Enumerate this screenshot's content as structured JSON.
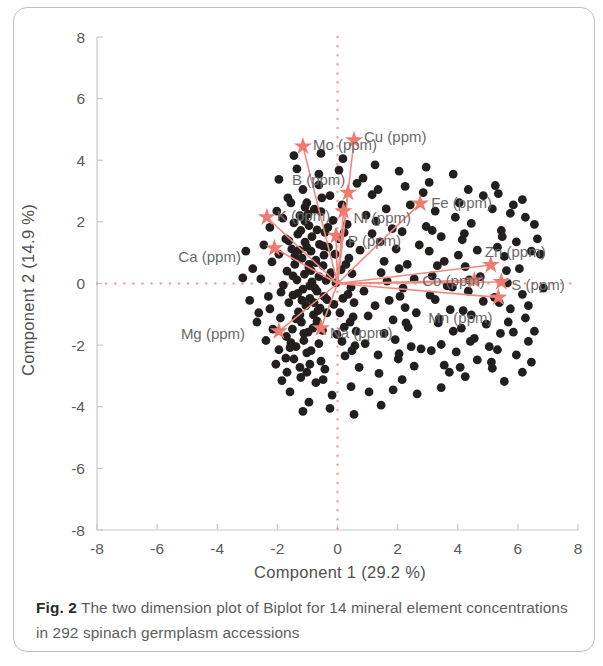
{
  "figure": {
    "caption_label": "Fig. 2",
    "caption_text": " The two dimension plot of Biplot for 14 mineral element concentrations in 292 spinach germplasm accessions"
  },
  "colors": {
    "vector": "#f08a80",
    "vector_dark": "#ee7a70",
    "point": "#231f1e",
    "axis": "#c9c9c9",
    "grid_ref": "#f3a09a",
    "text": "#5a5a5a",
    "frame": "#bfbfbf"
  },
  "chart_data": {
    "type": "scatter",
    "title": "",
    "subtitle": "",
    "xlabel": "Component 1  (29.2 %)",
    "ylabel": "Component 2  (14.9 %)",
    "xlim": [
      -8,
      8
    ],
    "ylim": [
      -8,
      8
    ],
    "xticks": [
      -8,
      -6,
      -4,
      -2,
      0,
      2,
      4,
      6,
      8
    ],
    "yticks": [
      -8,
      -6,
      -4,
      -2,
      0,
      2,
      4,
      6,
      8
    ],
    "xtick_labels": [
      "-8",
      "-6",
      "-4",
      "-2",
      "0",
      "2",
      "4",
      "6",
      "8"
    ],
    "ytick_labels": [
      "-8",
      "-6",
      "-4",
      "-2",
      "0",
      "2",
      "4",
      "6",
      "8"
    ],
    "grid": false,
    "reference_lines": {
      "x": 0,
      "y": 0,
      "style": "dotted",
      "color": "#f3a09a"
    },
    "legend": "none",
    "n_observations": 292,
    "n_variables": 14,
    "variance_explained": {
      "component_1": 29.2,
      "component_2": 14.9
    },
    "loading_vectors": [
      {
        "name": "Mo (ppm)",
        "x": -1.15,
        "y": 4.45,
        "label_dx": 10,
        "label_dy": 4,
        "label_anchor": "start"
      },
      {
        "name": "Cu (ppm)",
        "x": 0.55,
        "y": 4.65,
        "label_dx": 10,
        "label_dy": 2,
        "label_anchor": "start"
      },
      {
        "name": "B (ppm)",
        "x": 0.35,
        "y": 2.95,
        "label_dx": -56,
        "label_dy": -8,
        "label_anchor": "start"
      },
      {
        "name": "Fe (ppm)",
        "x": 2.75,
        "y": 2.6,
        "label_dx": 11,
        "label_dy": 5,
        "label_anchor": "start"
      },
      {
        "name": "K (ppm)",
        "x": -2.35,
        "y": 2.15,
        "label_dx": 10,
        "label_dy": 4,
        "label_anchor": "start"
      },
      {
        "name": "Ni (ppm)",
        "x": 0.2,
        "y": 2.35,
        "label_dx": 10,
        "label_dy": 12,
        "label_anchor": "start"
      },
      {
        "name": "P (ppm)",
        "x": -0.05,
        "y": 1.55,
        "label_dx": 12,
        "label_dy": 10,
        "label_anchor": "start"
      },
      {
        "name": "Ca (ppm)",
        "x": -2.1,
        "y": 1.15,
        "label_dx": -96,
        "label_dy": 14,
        "label_anchor": "start"
      },
      {
        "name": "Zn (ppm)",
        "x": 5.1,
        "y": 0.6,
        "label_dx": -6,
        "label_dy": -8,
        "label_anchor": "start"
      },
      {
        "name": "S (ppm)",
        "x": 5.45,
        "y": 0.05,
        "label_dx": 10,
        "label_dy": 8,
        "label_anchor": "start"
      },
      {
        "name": "Co (ppm)",
        "x": 4.55,
        "y": 0.1,
        "label_dx": -52,
        "label_dy": 6,
        "label_anchor": "start"
      },
      {
        "name": "Mn (ppm)",
        "x": 5.35,
        "y": -0.45,
        "label_dx": -70,
        "label_dy": 26,
        "label_anchor": "start"
      },
      {
        "name": "Na (ppm)",
        "x": -0.55,
        "y": -1.45,
        "label_dx": 9,
        "label_dy": 10,
        "label_anchor": "start"
      },
      {
        "name": "Mg (ppm)",
        "x": -1.95,
        "y": -1.55,
        "label_dx": -98,
        "label_dy": 8,
        "label_anchor": "start"
      }
    ],
    "scores": [
      [
        -1.02,
        2.62
      ],
      [
        -0.77,
        2.41
      ],
      [
        -1.25,
        2.2
      ],
      [
        -0.55,
        2.33
      ],
      [
        -1.45,
        1.97
      ],
      [
        -0.95,
        1.88
      ],
      [
        -0.68,
        1.74
      ],
      [
        -1.32,
        1.6
      ],
      [
        -0.42,
        1.66
      ],
      [
        -1.72,
        1.45
      ],
      [
        -1.08,
        1.34
      ],
      [
        -0.6,
        1.27
      ],
      [
        -1.52,
        1.12
      ],
      [
        -0.88,
        1.05
      ],
      [
        -0.3,
        1.18
      ],
      [
        -1.95,
        0.95
      ],
      [
        -1.18,
        0.82
      ],
      [
        -0.72,
        0.76
      ],
      [
        -1.42,
        0.62
      ],
      [
        -0.95,
        0.52
      ],
      [
        -0.48,
        0.58
      ],
      [
        -1.68,
        0.4
      ],
      [
        -1.1,
        0.3
      ],
      [
        -0.62,
        0.22
      ],
      [
        -1.35,
        0.12
      ],
      [
        -0.85,
        0.05
      ],
      [
        -0.38,
        0.1
      ],
      [
        -1.8,
        -0.05
      ],
      [
        -1.15,
        -0.18
      ],
      [
        -0.68,
        -0.25
      ],
      [
        -1.48,
        -0.38
      ],
      [
        -0.92,
        -0.48
      ],
      [
        -0.45,
        -0.42
      ],
      [
        -1.62,
        -0.62
      ],
      [
        -1.05,
        -0.72
      ],
      [
        -0.58,
        -0.8
      ],
      [
        -1.3,
        -0.92
      ],
      [
        -0.8,
        -1.02
      ],
      [
        -0.35,
        -0.95
      ],
      [
        -1.9,
        -1.12
      ],
      [
        -1.2,
        -1.25
      ],
      [
        -0.7,
        -1.35
      ],
      [
        -1.5,
        -1.48
      ],
      [
        -0.98,
        -1.58
      ],
      [
        -0.5,
        -1.52
      ],
      [
        -1.7,
        -1.72
      ],
      [
        -1.12,
        -1.85
      ],
      [
        -0.62,
        -1.95
      ],
      [
        -1.38,
        -2.05
      ],
      [
        -0.88,
        -2.18
      ],
      [
        -0.25,
        2.85
      ],
      [
        0.15,
        2.55
      ],
      [
        -0.15,
        2.05
      ],
      [
        0.32,
        1.92
      ],
      [
        0.05,
        1.45
      ],
      [
        0.42,
        1.3
      ],
      [
        -0.08,
        0.95
      ],
      [
        0.38,
        0.82
      ],
      [
        0.12,
        0.45
      ],
      [
        0.48,
        0.32
      ],
      [
        -0.05,
        0.02
      ],
      [
        0.45,
        -0.12
      ],
      [
        0.18,
        -0.48
      ],
      [
        0.55,
        -0.62
      ],
      [
        0.08,
        -0.95
      ],
      [
        0.52,
        -1.08
      ],
      [
        0.22,
        -1.42
      ],
      [
        0.62,
        -1.55
      ],
      [
        0.15,
        -1.88
      ],
      [
        0.58,
        -2.02
      ],
      [
        -1.15,
        3.05
      ],
      [
        -0.62,
        3.2
      ],
      [
        -1.65,
        2.78
      ],
      [
        -2.02,
        2.35
      ],
      [
        -2.25,
        1.82
      ],
      [
        -2.45,
        1.25
      ],
      [
        -2.18,
        0.7
      ],
      [
        -2.55,
        0.15
      ],
      [
        -2.3,
        -0.42
      ],
      [
        -2.62,
        -0.95
      ],
      [
        -2.15,
        -1.48
      ],
      [
        -1.95,
        -2.15
      ],
      [
        -1.45,
        -2.45
      ],
      [
        -0.92,
        -2.62
      ],
      [
        -0.42,
        -2.78
      ],
      [
        -1.68,
        -2.88
      ],
      [
        -1.22,
        -3.05
      ],
      [
        -0.72,
        -3.22
      ],
      [
        -1.88,
        -0.28
      ],
      [
        -2.38,
        -1.85
      ],
      [
        1.15,
        2.88
      ],
      [
        1.62,
        2.42
      ],
      [
        1.28,
        2.02
      ],
      [
        1.82,
        1.78
      ],
      [
        1.42,
        1.35
      ],
      [
        1.95,
        1.12
      ],
      [
        1.55,
        0.72
      ],
      [
        2.05,
        0.48
      ],
      [
        1.65,
        0.08
      ],
      [
        2.18,
        -0.15
      ],
      [
        1.72,
        -0.55
      ],
      [
        2.25,
        -0.78
      ],
      [
        1.85,
        -1.18
      ],
      [
        2.35,
        -1.42
      ],
      [
        1.92,
        -1.82
      ],
      [
        2.45,
        -2.05
      ],
      [
        2.02,
        -2.45
      ],
      [
        2.55,
        -2.68
      ],
      [
        1.38,
        -2.92
      ],
      [
        2.15,
        -3.12
      ],
      [
        2.85,
        2.95
      ],
      [
        3.25,
        2.35
      ],
      [
        2.95,
        1.85
      ],
      [
        3.45,
        1.52
      ],
      [
        3.05,
        1.05
      ],
      [
        3.55,
        0.72
      ],
      [
        3.15,
        0.25
      ],
      [
        3.65,
        -0.08
      ],
      [
        3.25,
        -0.52
      ],
      [
        3.75,
        -0.85
      ],
      [
        3.35,
        -1.28
      ],
      [
        3.85,
        -1.55
      ],
      [
        3.45,
        -1.98
      ],
      [
        3.95,
        -2.22
      ],
      [
        3.55,
        -2.65
      ],
      [
        4.05,
        2.62
      ],
      [
        4.45,
        1.95
      ],
      [
        4.15,
        1.42
      ],
      [
        4.65,
        1.08
      ],
      [
        4.25,
        0.55
      ],
      [
        4.75,
        0.22
      ],
      [
        4.35,
        -0.25
      ],
      [
        4.85,
        -0.58
      ],
      [
        4.45,
        -1.02
      ],
      [
        4.95,
        -1.32
      ],
      [
        4.55,
        -1.78
      ],
      [
        5.05,
        -2.05
      ],
      [
        4.65,
        -2.48
      ],
      [
        5.15,
        -2.75
      ],
      [
        4.25,
        -3.02
      ],
      [
        5.35,
        2.92
      ],
      [
        5.75,
        2.28
      ],
      [
        5.45,
        1.72
      ],
      [
        5.95,
        1.35
      ],
      [
        5.55,
        0.88
      ],
      [
        6.05,
        0.48
      ],
      [
        5.65,
        0.02
      ],
      [
        6.15,
        -0.35
      ],
      [
        5.75,
        -0.82
      ],
      [
        6.25,
        -1.12
      ],
      [
        5.85,
        -1.58
      ],
      [
        6.35,
        -1.88
      ],
      [
        5.95,
        -2.32
      ],
      [
        6.45,
        -2.55
      ],
      [
        5.55,
        -3.18
      ],
      [
        0.85,
        3.42
      ],
      [
        1.35,
        3.05
      ],
      [
        2.25,
        3.15
      ],
      [
        3.05,
        3.28
      ],
      [
        4.35,
        3.05
      ],
      [
        5.25,
        3.18
      ],
      [
        6.15,
        2.72
      ],
      [
        6.55,
        1.92
      ],
      [
        6.75,
        0.95
      ],
      [
        6.85,
        -0.15
      ],
      [
        0.45,
        -3.35
      ],
      [
        1.05,
        -3.52
      ],
      [
        1.85,
        -3.45
      ],
      [
        2.65,
        -3.58
      ],
      [
        3.45,
        -3.38
      ],
      [
        -0.18,
        -3.62
      ],
      [
        -0.95,
        -3.85
      ],
      [
        -1.58,
        -3.52
      ],
      [
        0.25,
        -2.35
      ],
      [
        0.72,
        -2.72
      ],
      [
        -1.08,
        2.02
      ],
      [
        -0.85,
        1.52
      ],
      [
        -1.28,
        1.08
      ],
      [
        -0.72,
        0.68
      ],
      [
        -1.48,
        0.25
      ],
      [
        -0.92,
        -0.08
      ],
      [
        -1.18,
        -0.55
      ],
      [
        -0.65,
        -0.88
      ],
      [
        -1.38,
        -1.15
      ],
      [
        -0.82,
        -1.45
      ],
      [
        -1.55,
        -1.92
      ],
      [
        -1.02,
        -2.25
      ],
      [
        -0.55,
        -2.52
      ],
      [
        -1.72,
        -2.42
      ],
      [
        -1.25,
        -2.72
      ],
      [
        -0.32,
        1.82
      ],
      [
        0.22,
        1.65
      ],
      [
        -0.48,
        1.22
      ],
      [
        0.28,
        0.62
      ],
      [
        -0.22,
        0.35
      ],
      [
        0.35,
        -0.35
      ],
      [
        -0.12,
        -0.68
      ],
      [
        0.42,
        -1.25
      ],
      [
        -0.02,
        -1.65
      ],
      [
        0.48,
        -2.18
      ],
      [
        -2.82,
        0.48
      ],
      [
        -2.92,
        -0.55
      ],
      [
        -3.05,
        1.05
      ],
      [
        -2.68,
        -1.25
      ],
      [
        -3.15,
        0.18
      ],
      [
        2.42,
        2.55
      ],
      [
        2.72,
        1.25
      ],
      [
        2.55,
        0.15
      ],
      [
        2.62,
        -0.95
      ],
      [
        2.78,
        -2.12
      ],
      [
        3.92,
        2.15
      ],
      [
        4.02,
        0.92
      ],
      [
        3.82,
        -0.12
      ],
      [
        4.12,
        -1.45
      ],
      [
        3.72,
        -2.88
      ],
      [
        5.15,
        2.42
      ],
      [
        5.32,
        1.18
      ],
      [
        5.22,
        -0.45
      ],
      [
        5.42,
        -1.62
      ],
      [
        5.12,
        -2.55
      ],
      [
        6.25,
        2.15
      ],
      [
        6.45,
        1.05
      ],
      [
        6.35,
        -0.72
      ],
      [
        6.55,
        -1.55
      ],
      [
        6.15,
        -2.88
      ],
      [
        -0.62,
        3.55
      ],
      [
        0.05,
        3.68
      ],
      [
        -1.35,
        3.72
      ],
      [
        0.65,
        3.25
      ],
      [
        -1.95,
        3.38
      ],
      [
        1.15,
        1.62
      ],
      [
        1.45,
        0.35
      ],
      [
        1.25,
        -0.72
      ],
      [
        1.55,
        -1.62
      ],
      [
        1.35,
        -2.32
      ],
      [
        -0.45,
        0.92
      ],
      [
        -0.95,
        0.62
      ],
      [
        -0.25,
        0.25
      ],
      [
        -0.75,
        -0.15
      ],
      [
        -0.35,
        -0.52
      ],
      [
        -1.08,
        2.48
      ],
      [
        -1.55,
        2.62
      ],
      [
        -0.98,
        2.25
      ],
      [
        -0.52,
        2.78
      ],
      [
        -1.82,
        2.12
      ],
      [
        -1.22,
        1.72
      ],
      [
        -1.62,
        1.38
      ],
      [
        -1.02,
        1.18
      ],
      [
        -1.42,
        0.88
      ],
      [
        -0.88,
        0.42
      ],
      [
        -1.32,
        -0.32
      ],
      [
        -0.78,
        -0.62
      ],
      [
        -1.25,
        -1.02
      ],
      [
        -0.68,
        -1.22
      ],
      [
        -1.12,
        -1.62
      ],
      [
        -1.58,
        -2.08
      ],
      [
        -1.02,
        -2.88
      ],
      [
        -0.48,
        -3.12
      ],
      [
        -2.05,
        -2.62
      ],
      [
        -2.25,
        -0.82
      ],
      [
        0.95,
        2.22
      ],
      [
        0.75,
        1.08
      ],
      [
        0.88,
        -0.25
      ],
      [
        1.02,
        -1.05
      ],
      [
        0.92,
        -1.95
      ],
      [
        2.15,
        1.68
      ],
      [
        2.32,
        0.62
      ],
      [
        2.08,
        -0.42
      ],
      [
        2.28,
        -1.28
      ],
      [
        2.05,
        -2.28
      ],
      [
        3.15,
        1.72
      ],
      [
        3.32,
        0.58
      ],
      [
        3.08,
        -0.38
      ],
      [
        3.38,
        -1.15
      ],
      [
        3.12,
        -2.18
      ],
      [
        4.22,
        1.62
      ],
      [
        4.38,
        0.12
      ],
      [
        4.18,
        -0.88
      ],
      [
        4.42,
        -1.88
      ],
      [
        4.08,
        -2.72
      ],
      [
        5.48,
        1.52
      ],
      [
        5.62,
        0.42
      ],
      [
        5.38,
        -0.62
      ],
      [
        5.68,
        -1.25
      ],
      [
        5.32,
        -2.15
      ],
      [
        0.18,
        4.05
      ],
      [
        -0.55,
        4.22
      ],
      [
        1.25,
        3.85
      ],
      [
        -1.45,
        4.15
      ],
      [
        2.05,
        3.65
      ],
      [
        -0.25,
        -4.05
      ],
      [
        0.55,
        -4.25
      ],
      [
        -1.15,
        -4.15
      ],
      [
        1.45,
        -3.95
      ],
      [
        -1.85,
        -3.15
      ],
      [
        3.85,
        3.55
      ],
      [
        4.85,
        2.85
      ],
      [
        5.85,
        2.55
      ],
      [
        6.65,
        1.45
      ],
      [
        2.95,
        3.78
      ]
    ]
  }
}
